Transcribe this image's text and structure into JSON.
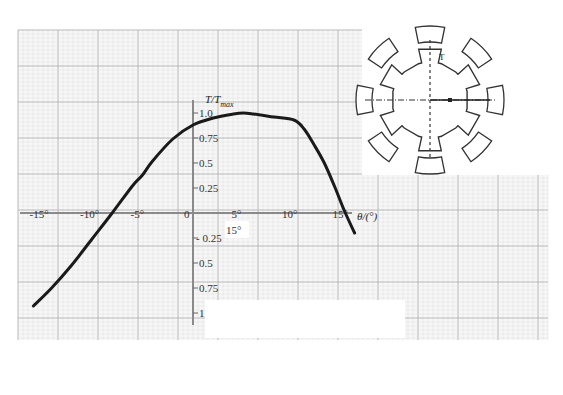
{
  "chart_data": {
    "type": "line",
    "title": "",
    "xlabel": "θ/(°)",
    "ylabel": "T/T_max",
    "ylabel_main": "T/T",
    "ylabel_sub": "max",
    "xlim": [
      -16,
      17
    ],
    "ylim": [
      -1.0,
      1.0
    ],
    "x_ticks": [
      {
        "value": -15,
        "label": "-15°"
      },
      {
        "value": -10,
        "label": "-10°"
      },
      {
        "value": -5,
        "label": "-5°"
      },
      {
        "value": 0,
        "label": "0"
      },
      {
        "value": 5,
        "label": "5°"
      },
      {
        "value": 10,
        "label": "10°"
      },
      {
        "value": 15,
        "label": "15°"
      }
    ],
    "y_ticks": [
      {
        "value": 1.0,
        "label": "1.0"
      },
      {
        "value": 0.75,
        "label": "0.75"
      },
      {
        "value": 0.5,
        "label": "0.5"
      },
      {
        "value": 0.25,
        "label": "0.25"
      },
      {
        "value": -0.25,
        "label": "- 0.25"
      },
      {
        "value": -0.5,
        "label": "0.5"
      },
      {
        "value": -0.75,
        "label": "0.75"
      },
      {
        "value": -1.0,
        "label": "1.0"
      }
    ],
    "annotations": [
      {
        "text": "15°",
        "x": 3.8,
        "y": -0.2
      }
    ],
    "grid": true,
    "series": [
      {
        "name": "T/Tmax vs θ",
        "x": [
          -15.8,
          -14,
          -12,
          -10,
          -8,
          -6,
          -5,
          -4,
          -2,
          0,
          2,
          4,
          5,
          6,
          8,
          10,
          11,
          12,
          13,
          14,
          15,
          16
        ],
        "values": [
          -0.93,
          -0.75,
          -0.52,
          -0.26,
          0.0,
          0.27,
          0.38,
          0.52,
          0.74,
          0.88,
          0.95,
          0.99,
          1.0,
          0.99,
          0.96,
          0.93,
          0.84,
          0.68,
          0.5,
          0.27,
          0.02,
          -0.2
        ]
      }
    ],
    "inset": {
      "description": "switched reluctance motor cross-section: 8 stator poles, 6 rotor teeth",
      "label": "T"
    }
  },
  "colors": {
    "curve": "#1a1a1a",
    "grid_major": "#b8b8b8",
    "grid_minor": "#dcdcdc",
    "axis": "#777777"
  }
}
